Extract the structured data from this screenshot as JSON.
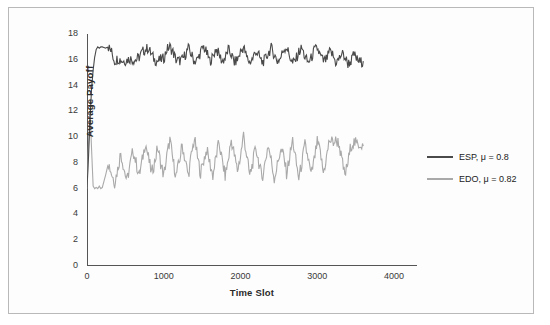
{
  "chart_data": {
    "type": "line",
    "title": "",
    "xlabel": "Time Slot",
    "ylabel": "Average Payoff",
    "xlim": [
      0,
      4300
    ],
    "ylim": [
      0,
      18
    ],
    "xticks": [
      0,
      1000,
      2000,
      3000,
      4000
    ],
    "ytick_labels": [
      "0",
      "2",
      "4",
      "6",
      "8",
      "10",
      "12",
      "14",
      "16",
      "18"
    ],
    "yticks": [
      0,
      2,
      4,
      6,
      8,
      10,
      12,
      14,
      16,
      18
    ],
    "grid": false,
    "legend_position": "right",
    "series": [
      {
        "name": "ESP, μ = 0.8",
        "color": "#4a4a4a",
        "mean_level": 16.2,
        "x": [
          0,
          20,
          40,
          60,
          80,
          100,
          120,
          140,
          160,
          180,
          200,
          240,
          280,
          320,
          360,
          400,
          440,
          480,
          520,
          560,
          600,
          640,
          680,
          720,
          760,
          800,
          840,
          880,
          920,
          960,
          1000,
          1040,
          1080,
          1120,
          1160,
          1200,
          1240,
          1280,
          1320,
          1360,
          1400,
          1440,
          1480,
          1520,
          1560,
          1600,
          1640,
          1680,
          1720,
          1760,
          1800,
          1840,
          1880,
          1920,
          1960,
          2000,
          2040,
          2080,
          2120,
          2160,
          2200,
          2240,
          2280,
          2320,
          2360,
          2400,
          2440,
          2480,
          2520,
          2560,
          2600,
          2640,
          2680,
          2720,
          2760,
          2800,
          2840,
          2880,
          2920,
          2960,
          3000,
          3040,
          3080,
          3120,
          3160,
          3200,
          3240,
          3280,
          3320,
          3360,
          3400,
          3440,
          3480,
          3520,
          3560,
          3600
        ],
        "values": [
          6.0,
          8.5,
          11.5,
          13.8,
          15.2,
          16.2,
          16.8,
          17.0,
          16.9,
          17.0,
          17.0,
          16.9,
          17.0,
          16.6,
          15.9,
          16.1,
          16.0,
          15.9,
          16.0,
          16.1,
          16.0,
          16.0,
          16.2,
          16.6,
          16.8,
          16.9,
          16.4,
          16.0,
          15.9,
          16.0,
          16.1,
          16.8,
          17.0,
          16.6,
          16.0,
          15.9,
          16.0,
          16.4,
          16.9,
          16.4,
          15.9,
          16.0,
          16.6,
          17.0,
          16.5,
          15.9,
          16.2,
          16.9,
          16.4,
          15.9,
          16.1,
          16.8,
          16.4,
          15.8,
          16.0,
          16.6,
          17.0,
          16.2,
          15.8,
          16.1,
          16.7,
          16.3,
          15.8,
          16.0,
          16.5,
          16.9,
          16.4,
          15.9,
          16.1,
          16.8,
          17.0,
          16.3,
          15.7,
          16.0,
          16.6,
          16.9,
          16.2,
          15.8,
          16.1,
          16.7,
          16.9,
          16.3,
          15.9,
          16.0,
          16.6,
          16.4,
          15.8,
          16.0,
          16.5,
          16.2,
          15.7,
          15.9,
          16.4,
          16.0,
          15.8,
          15.9
        ]
      },
      {
        "name": "EDO, μ = 0.82",
        "color": "#a9a9a9",
        "mean_level": 8.2,
        "x": [
          0,
          20,
          40,
          60,
          80,
          100,
          120,
          140,
          160,
          180,
          200,
          240,
          280,
          320,
          360,
          400,
          440,
          480,
          520,
          560,
          600,
          640,
          680,
          720,
          760,
          800,
          840,
          880,
          920,
          960,
          1000,
          1040,
          1080,
          1120,
          1160,
          1200,
          1240,
          1280,
          1320,
          1360,
          1400,
          1440,
          1480,
          1520,
          1560,
          1600,
          1640,
          1680,
          1720,
          1760,
          1800,
          1840,
          1880,
          1920,
          1960,
          2000,
          2040,
          2080,
          2120,
          2160,
          2200,
          2240,
          2280,
          2320,
          2360,
          2400,
          2440,
          2480,
          2520,
          2560,
          2600,
          2640,
          2680,
          2720,
          2760,
          2800,
          2840,
          2880,
          2920,
          2960,
          3000,
          3040,
          3080,
          3120,
          3160,
          3200,
          3240,
          3280,
          3320,
          3360,
          3400,
          3440,
          3480,
          3520,
          3560,
          3600
        ],
        "values": [
          6.0,
          9.5,
          12.0,
          9.0,
          6.2,
          6.0,
          6.1,
          6.0,
          6.2,
          6.0,
          6.1,
          7.0,
          8.0,
          7.2,
          6.5,
          7.5,
          8.8,
          7.6,
          6.6,
          7.8,
          9.0,
          8.0,
          7.0,
          8.2,
          9.6,
          8.4,
          7.2,
          8.0,
          9.2,
          8.0,
          7.0,
          8.5,
          9.8,
          8.2,
          7.0,
          8.0,
          9.4,
          8.2,
          7.0,
          8.6,
          9.9,
          8.4,
          7.2,
          8.2,
          9.0,
          8.0,
          7.0,
          8.4,
          9.6,
          8.2,
          7.0,
          8.2,
          9.8,
          8.6,
          7.4,
          8.5,
          10.2,
          8.6,
          7.0,
          8.0,
          9.2,
          8.0,
          6.8,
          8.0,
          9.4,
          8.2,
          6.8,
          7.8,
          9.0,
          8.6,
          7.2,
          8.4,
          9.8,
          8.2,
          6.8,
          8.0,
          9.4,
          8.4,
          7.0,
          8.2,
          9.6,
          8.8,
          7.2,
          8.4,
          9.8,
          9.6,
          9.7,
          9.6,
          8.2,
          7.0,
          8.0,
          9.4,
          9.6,
          9.4,
          9.5,
          9.3
        ]
      }
    ]
  },
  "legend": {
    "entries": [
      {
        "label": "ESP, μ = 0.8",
        "color": "#4a4a4a"
      },
      {
        "label": "EDO, μ = 0.82",
        "color": "#a9a9a9"
      }
    ]
  },
  "axis": {
    "x_title": "Time Slot",
    "y_title": "Average Payoff",
    "x_tick_labels": [
      "0",
      "1000",
      "2000",
      "3000",
      "4000"
    ],
    "y_tick_labels": [
      "0",
      "2",
      "4",
      "6",
      "8",
      "10",
      "12",
      "14",
      "16",
      "18"
    ]
  }
}
